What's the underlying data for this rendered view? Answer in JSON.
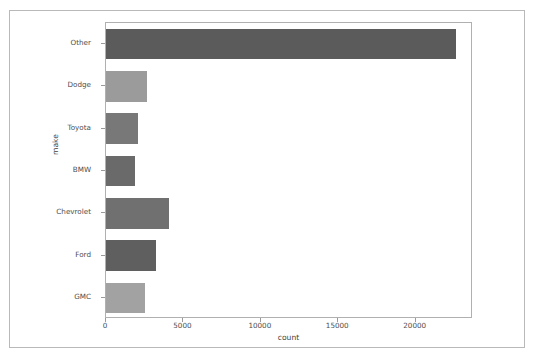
{
  "chart_data": {
    "type": "bar",
    "orientation": "horizontal",
    "title": "",
    "xlabel": "count",
    "ylabel": "make",
    "categories": [
      "Other",
      "Dodge",
      "Toyota",
      "BMW",
      "Chevrolet",
      "Ford",
      "GMC"
    ],
    "values": [
      22600,
      2650,
      2050,
      1900,
      4100,
      3250,
      2550
    ],
    "bar_colors": [
      "#5b5b5b",
      "#9b9b9b",
      "#787878",
      "#6a6a6a",
      "#707070",
      "#5f5f5f",
      "#a2a2a2"
    ],
    "xlim": [
      0,
      23700
    ],
    "ylim": [
      0,
      7
    ],
    "xticks": [
      0,
      5000,
      10000,
      15000,
      20000
    ],
    "xticklabels": [
      "0",
      "5000",
      "10000",
      "15000",
      "20000"
    ],
    "yticklabels": [
      "Other",
      "Dodge",
      "Toyota",
      "BMW",
      "Chevrolet",
      "Ford",
      "GMC"
    ],
    "grid": false,
    "legend": null,
    "legend_position": "none"
  },
  "figure": {
    "background_color": "#ffffff",
    "frame_color": "#b9b9b9",
    "axes_edge_color": "#b0b0b0",
    "tick_color": "#9a9a9a",
    "tick_label_color": "#4d4d4d",
    "axis_label_color": "#3f3f3f"
  }
}
